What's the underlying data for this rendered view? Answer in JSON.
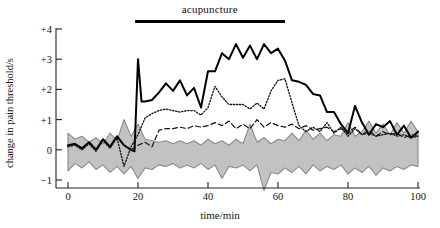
{
  "chart_data": {
    "type": "line",
    "title": "",
    "xlabel": "time/min",
    "ylabel": "change in pain threshold/s",
    "xlim": [
      -2,
      102
    ],
    "ylim": [
      -1.6,
      4.3
    ],
    "xticks": [
      0,
      20,
      40,
      60,
      80,
      100
    ],
    "xtick_labels": [
      "0",
      "20",
      "40",
      "60",
      "80",
      "100"
    ],
    "yticks": [
      -1,
      0,
      1,
      2,
      3,
      4
    ],
    "ytick_labels": [
      "−1",
      "0",
      "+1",
      "+2",
      "+3",
      "+4"
    ],
    "grid": false,
    "legend": "none",
    "annotations": [
      {
        "text": "acupuncture",
        "type": "treatment-span-bar",
        "x_start": 19,
        "x_end": 62,
        "y": 4.3
      }
    ],
    "series": [
      {
        "name": "solid-line",
        "style": "solid",
        "color": "#000000",
        "width": 2.0,
        "x": [
          0,
          2,
          4,
          6,
          8,
          10,
          12,
          14,
          16,
          18,
          19,
          20,
          21,
          22,
          24,
          26,
          28,
          30,
          32,
          34,
          36,
          38,
          40,
          42,
          44,
          46,
          48,
          50,
          52,
          54,
          56,
          58,
          60,
          62,
          64,
          66,
          68,
          70,
          72,
          74,
          76,
          78,
          80,
          82,
          84,
          86,
          88,
          90,
          92,
          94,
          96,
          98,
          100
        ],
        "values": [
          0.15,
          0.2,
          0.05,
          0.25,
          0.0,
          0.35,
          0.1,
          0.45,
          0.15,
          0.0,
          -0.05,
          3.0,
          1.6,
          1.6,
          1.65,
          1.9,
          2.2,
          1.95,
          2.3,
          1.8,
          2.05,
          1.4,
          2.6,
          2.6,
          3.2,
          3.0,
          3.5,
          3.05,
          3.45,
          3.0,
          3.5,
          3.2,
          3.35,
          2.95,
          2.3,
          2.25,
          2.15,
          1.85,
          1.8,
          1.25,
          1.25,
          0.85,
          0.55,
          1.45,
          0.9,
          0.5,
          0.85,
          0.75,
          0.95,
          0.5,
          0.8,
          0.4,
          0.6
        ]
      },
      {
        "name": "dotted-line",
        "style": "dotted",
        "color": "#111111",
        "width": 1.3,
        "x": [
          0,
          2,
          4,
          6,
          8,
          10,
          12,
          14,
          16,
          18,
          20,
          22,
          24,
          26,
          28,
          30,
          32,
          34,
          36,
          38,
          40,
          42,
          44,
          46,
          48,
          50,
          52,
          54,
          56,
          58,
          60,
          62,
          64,
          66,
          68,
          70,
          72,
          74,
          76,
          78,
          80,
          82,
          84,
          86,
          88,
          90,
          92,
          94,
          96,
          98,
          100
        ],
        "values": [
          0.1,
          0.15,
          0.0,
          0.2,
          -0.05,
          0.3,
          0.05,
          0.4,
          -0.55,
          0.1,
          0.5,
          1.05,
          1.2,
          1.3,
          1.35,
          1.3,
          1.25,
          1.3,
          1.3,
          1.15,
          1.4,
          2.1,
          1.75,
          1.5,
          1.5,
          1.5,
          1.35,
          1.55,
          1.35,
          1.95,
          2.3,
          2.35,
          1.55,
          0.8,
          0.6,
          0.75,
          0.6,
          0.9,
          0.55,
          0.75,
          0.45,
          0.7,
          0.5,
          0.55,
          0.45,
          0.5,
          0.55,
          0.45,
          0.5,
          0.4,
          0.45
        ]
      },
      {
        "name": "dashed-line",
        "style": "dashed",
        "color": "#111111",
        "width": 1.2,
        "x": [
          18,
          20,
          22,
          24,
          26,
          28,
          30,
          32,
          34,
          36,
          38,
          40,
          42,
          44,
          46,
          48,
          50,
          52,
          54,
          56,
          58,
          60,
          62,
          64,
          66,
          68,
          70,
          72,
          74,
          76,
          78,
          80,
          82,
          84,
          86,
          88,
          90,
          92,
          94,
          96,
          98,
          100
        ],
        "values": [
          0.0,
          0.15,
          0.25,
          0.1,
          0.65,
          0.7,
          0.7,
          0.75,
          0.7,
          0.8,
          0.75,
          0.8,
          0.9,
          0.8,
          0.95,
          0.7,
          0.85,
          0.7,
          1.0,
          0.75,
          0.9,
          0.8,
          0.75,
          0.85,
          0.7,
          0.8,
          0.65,
          0.7,
          0.75,
          0.6,
          0.7,
          0.55,
          0.75,
          0.5,
          0.65,
          0.45,
          0.6,
          0.5,
          0.55,
          0.4,
          0.5,
          0.45
        ]
      }
    ],
    "band": {
      "name": "control-range-band",
      "fill": "#c2c2c2",
      "edge": "#8a8a8a",
      "x": [
        0,
        2,
        4,
        6,
        8,
        10,
        12,
        14,
        16,
        18,
        20,
        22,
        24,
        26,
        28,
        30,
        32,
        34,
        36,
        38,
        40,
        42,
        44,
        46,
        48,
        50,
        52,
        54,
        56,
        58,
        60,
        62,
        64,
        66,
        68,
        70,
        72,
        74,
        76,
        78,
        80,
        82,
        84,
        86,
        88,
        90,
        92,
        94,
        96,
        98,
        100
      ],
      "upper": [
        0.55,
        0.35,
        0.45,
        0.25,
        0.4,
        0.2,
        0.55,
        0.3,
        1.0,
        0.45,
        0.85,
        0.35,
        0.3,
        0.25,
        0.3,
        0.2,
        0.3,
        0.2,
        0.3,
        0.15,
        0.35,
        0.2,
        0.3,
        0.15,
        0.35,
        0.2,
        0.85,
        0.25,
        0.4,
        0.2,
        0.35,
        0.3,
        0.55,
        0.3,
        0.65,
        0.35,
        0.55,
        0.3,
        0.5,
        0.45,
        0.9,
        0.45,
        0.6,
        0.95,
        0.55,
        0.85,
        0.5,
        0.9,
        0.55,
        0.95,
        0.6
      ],
      "lower": [
        -0.7,
        -0.45,
        -0.6,
        -0.4,
        -0.65,
        -0.5,
        -0.75,
        -0.55,
        -0.8,
        -0.55,
        -0.95,
        -0.6,
        -0.65,
        -0.5,
        -0.55,
        -0.45,
        -0.6,
        -0.5,
        -0.6,
        -0.45,
        -0.65,
        -0.5,
        -0.95,
        -0.55,
        -0.6,
        -0.5,
        -0.7,
        -0.5,
        -1.35,
        -0.75,
        -0.8,
        -0.6,
        -0.75,
        -0.55,
        -0.8,
        -0.5,
        -0.7,
        -0.55,
        -0.65,
        -0.5,
        -0.8,
        -0.6,
        -0.75,
        -0.55,
        -0.85,
        -0.6,
        -0.7,
        -0.55,
        -0.65,
        -0.5,
        -0.55
      ]
    }
  }
}
